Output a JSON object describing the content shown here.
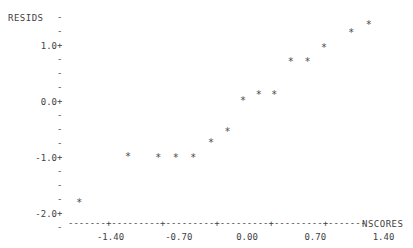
{
  "chart_data": {
    "type": "scatter",
    "title": "",
    "xlabel": "NSCORES",
    "ylabel": "RESIDS",
    "xlim": [
      -1.95,
      2.35
    ],
    "ylim": [
      -2.05,
      1.65
    ],
    "xticks": [
      -1.4,
      -0.7,
      0.0,
      0.7,
      1.4
    ],
    "xtick_labels": [
      "-1.40",
      "-0.70",
      "0.00",
      "0.70",
      "1.40"
    ],
    "yticks": [
      1.0,
      0.0,
      -1.0,
      -2.0
    ],
    "ytick_labels": [
      "1.0+",
      "0.0+",
      "-1.0+",
      "-2.0+"
    ],
    "minor_tick_glyph": "-",
    "major_tick_glyph": "+",
    "point_marker": "*",
    "grid": false,
    "legend": null,
    "points": [
      {
        "x": -1.72,
        "y": -1.71
      },
      {
        "x": -1.22,
        "y": -0.89
      },
      {
        "x": -0.91,
        "y": -0.91
      },
      {
        "x": -0.73,
        "y": -0.91
      },
      {
        "x": -0.55,
        "y": -0.91
      },
      {
        "x": -0.37,
        "y": -0.64
      },
      {
        "x": -0.2,
        "y": -0.45
      },
      {
        "x": -0.04,
        "y": 0.11
      },
      {
        "x": 0.12,
        "y": 0.21
      },
      {
        "x": 0.28,
        "y": 0.21
      },
      {
        "x": 0.45,
        "y": 0.8
      },
      {
        "x": 0.62,
        "y": 0.8
      },
      {
        "x": 0.79,
        "y": 1.05
      },
      {
        "x": 1.07,
        "y": 1.32
      },
      {
        "x": 1.25,
        "y": 1.46
      },
      {
        "x": 1.93,
        "y": 1.46
      }
    ]
  },
  "axes": {
    "x_axis_dashes": "-------+---------+---------+---------+---------+-------",
    "y_title": "RESIDS",
    "x_title": "NSCORES"
  }
}
